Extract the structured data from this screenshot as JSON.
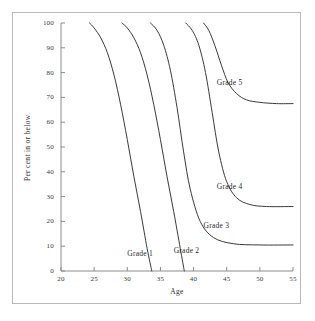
{
  "chart_data": {
    "type": "line",
    "title": "",
    "subtitle": "",
    "xlabel": "Age",
    "ylabel": "Per cent in or below",
    "xlim": [
      20,
      55
    ],
    "ylim": [
      0,
      100
    ],
    "xticks": [
      20,
      25,
      30,
      35,
      40,
      45,
      50,
      55
    ],
    "xtick_labels": [
      "20",
      "25",
      "30",
      "35",
      "40",
      "45",
      "50",
      "55"
    ],
    "yticks": [
      0,
      10,
      20,
      30,
      40,
      50,
      60,
      70,
      80,
      90,
      100
    ],
    "ytick_labels": [
      "0",
      "10",
      "20",
      "30",
      "40",
      "50",
      "60",
      "70",
      "80",
      "90",
      "100"
    ],
    "grid": false,
    "legend_position": "inline-annotations",
    "line_color": "#3a3a3a",
    "axis_color": "#8c8c8c",
    "frame_color": "#b9b9b9",
    "series": [
      {
        "name": "Grade 1",
        "label": "Grade 1",
        "label_x": 30.0,
        "label_y": 7.0,
        "plateau": 0,
        "x": [
          24.3,
          25.0,
          26.0,
          27.0,
          28.0,
          29.0,
          30.0,
          31.0,
          32.0,
          33.0,
          33.7
        ],
        "values": [
          100,
          98,
          94,
          88,
          79,
          67,
          53,
          38,
          24,
          9,
          0
        ]
      },
      {
        "name": "Grade 2",
        "label": "Grade 2",
        "label_x": 37.0,
        "label_y": 8.0,
        "plateau": 0,
        "x": [
          29.2,
          30.0,
          31.0,
          32.0,
          33.0,
          34.0,
          35.0,
          36.0,
          37.0,
          38.0,
          38.6
        ],
        "values": [
          100,
          98,
          94,
          88,
          79,
          67,
          53,
          38,
          24,
          9,
          0
        ]
      },
      {
        "name": "Grade 3",
        "label": "Grade 3",
        "label_x": 41.5,
        "label_y": 18.0,
        "plateau": 10.5,
        "x": [
          33.5,
          34.5,
          35.5,
          36.5,
          37.5,
          38.5,
          39.5,
          41.0,
          43.0,
          46.0,
          50.0,
          55.0
        ],
        "values": [
          100,
          97,
          91,
          81,
          66,
          48,
          33,
          20,
          13.5,
          11.0,
          10.5,
          10.5
        ]
      },
      {
        "name": "Grade 4",
        "label": "Grade 4",
        "label_x": 43.5,
        "label_y": 34.0,
        "plateau": 26.0,
        "x": [
          38.8,
          39.8,
          40.8,
          41.8,
          42.8,
          43.8,
          45.0,
          46.5,
          48.5,
          51.0,
          55.0
        ],
        "values": [
          100,
          97,
          91,
          80,
          64,
          48,
          36,
          29.5,
          26.8,
          26.0,
          26.0
        ]
      },
      {
        "name": "Grade 5",
        "label": "Grade 5",
        "label_x": 43.5,
        "label_y": 76.0,
        "plateau": 67.5,
        "x": [
          41.5,
          42.3,
          43.2,
          44.2,
          45.2,
          46.5,
          48.0,
          50.0,
          52.5,
          55.0
        ],
        "values": [
          100,
          97,
          91,
          83,
          76,
          71.5,
          69.0,
          68.0,
          67.5,
          67.5
        ]
      }
    ]
  }
}
